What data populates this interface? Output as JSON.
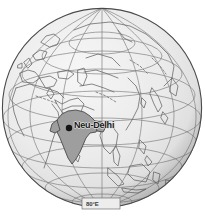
{
  "figure": {
    "kind": "orthographic-globe-map",
    "background_color": "#ffffff"
  },
  "globe": {
    "center_x": 102,
    "center_y": 108,
    "radius": 100,
    "ocean_fill": "#e8e8e8",
    "ocean_highlight": "#f4f4f4",
    "rim_shadow": "#9a9a9a",
    "outline_color": "#4a4a4a",
    "graticule_color": "#7a7a7a",
    "coastline_color": "#6b6b6b",
    "projection": "orthographic",
    "center_longitude": 80,
    "center_latitude": 20
  },
  "highlight_country": {
    "name": "India",
    "fill_color": "#9e9e9e",
    "stroke_color": "#4a4a4a"
  },
  "marker": {
    "name": "Neu-Delhi",
    "label": "Neu-Delhi",
    "dot_color": "#141414",
    "dot_radius": 3.2,
    "x": 69,
    "y": 128
  },
  "labels": {
    "city": "Neu-Delhi",
    "longitude": "80°E"
  },
  "graticule": {
    "meridian_step_deg": 20,
    "parallel_step_deg": 20,
    "show_polar_circle": true
  }
}
